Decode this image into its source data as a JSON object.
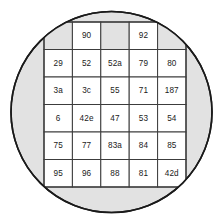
{
  "figure": {
    "background_color": "#ffffff"
  },
  "wafer": {
    "shape": "circle",
    "center_x": 111.5,
    "center_y": 112,
    "radius": 100.5,
    "fill_color": "#e2e2e2",
    "stroke_color": "#1a1a1a",
    "stroke_width": 1.6
  },
  "grid": {
    "left": 44,
    "top": 22,
    "right": 186,
    "bottom": 187,
    "columns": 5,
    "rows": 6,
    "cell_width": 28.4,
    "cell_height": 27.5,
    "cell_fill_labeled": "#ffffff",
    "cell_fill_unlabeled": "#e2e2e2",
    "border_color": "#3c3c3c",
    "border_width": 1,
    "outer_border_width": 1.3
  },
  "chart_data": {
    "type": "table",
    "title": "",
    "rows": [
      [
        "",
        "90",
        "",
        "92",
        ""
      ],
      [
        "29",
        "52",
        "52a",
        "79",
        "80"
      ],
      [
        "3a",
        "3c",
        "55",
        "71",
        "187"
      ],
      [
        "6",
        "42e",
        "47",
        "53",
        "54"
      ],
      [
        "75",
        "77",
        "83a",
        "84",
        "85"
      ],
      [
        "95",
        "96",
        "88",
        "81",
        "42d"
      ]
    ]
  }
}
